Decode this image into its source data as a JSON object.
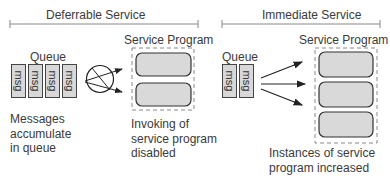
{
  "deferrable": {
    "title": "Deferrable Service",
    "queue_label": "Queue",
    "messages": [
      "msg",
      "msg",
      "msg",
      "msg"
    ],
    "service_program_label": "Service Program",
    "instances": 2,
    "queue_caption": "Messages\naccumulate\nin queue",
    "program_caption": "Invoking of\nservice program\ndisabled",
    "connector_icon": "prohibited-circle-icon"
  },
  "immediate": {
    "title": "Immediate Service",
    "queue_label": "Queue",
    "messages": [
      "msg",
      "msg"
    ],
    "service_program_label": "Service Program",
    "instances": 3,
    "program_caption": "Instances of service\nprogram increased"
  },
  "colors": {
    "line": "#444444",
    "box_fill": "#d9d9d9",
    "dashed": "#888888",
    "text": "#3a3a3a"
  }
}
